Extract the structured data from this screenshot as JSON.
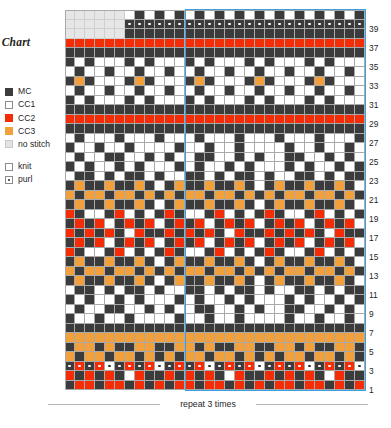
{
  "title": "r Chart",
  "legend": {
    "colors": [
      {
        "key": "MC",
        "label": "MC",
        "hex": "#3b3b3b",
        "swatch": "sw-mc"
      },
      {
        "key": "CC1",
        "label": "CC1",
        "hex": "#ffffff",
        "swatch": "sw-cc1"
      },
      {
        "key": "CC2",
        "label": "CC2",
        "hex": "#f42d06",
        "swatch": "sw-cc2"
      },
      {
        "key": "CC3",
        "label": "CC3",
        "hex": "#f2a03c",
        "swatch": "sw-cc3"
      },
      {
        "key": "NS",
        "label": "no stitch",
        "hex": "#e6e6e6",
        "swatch": "sw-nostitch"
      }
    ],
    "stitches": [
      {
        "key": "knit",
        "label": "knit",
        "swatch": "sw-knit"
      },
      {
        "key": "purl",
        "label": "purl",
        "swatch": "sw-purl"
      }
    ]
  },
  "repeat_caption": "repeat 3 times",
  "repeat_box": {
    "start_col": 13,
    "end_col": 30,
    "color": "#3d9ee0"
  },
  "grid": {
    "columns": 30,
    "rows": 40,
    "cell_px": 10,
    "row_numbers": [
      39,
      37,
      35,
      33,
      31,
      29,
      27,
      25,
      23,
      21,
      19,
      17,
      15,
      13,
      11,
      9,
      7,
      5,
      3,
      1
    ]
  },
  "chart_data": {
    "type": "heatmap",
    "title": "r Chart",
    "xlabel": "",
    "ylabel": "",
    "legend_position": "left",
    "grid": true,
    "palette": {
      "MC": "#3b3b3b",
      "CC1": "#ffffff",
      "CC2": "#f42d06",
      "CC3": "#f2a03c",
      "NS": "#e6e6e6"
    },
    "columns": 30,
    "rows": 40,
    "row_labels_top_to_bottom": [
      40,
      39,
      38,
      37,
      36,
      35,
      34,
      33,
      32,
      31,
      30,
      29,
      28,
      27,
      26,
      25,
      24,
      23,
      22,
      21,
      20,
      19,
      18,
      17,
      16,
      15,
      14,
      13,
      12,
      11,
      10,
      9,
      8,
      7,
      6,
      5,
      4,
      3,
      2,
      1
    ],
    "purl_rows_top_to_bottom": [
      1,
      37
    ],
    "cells": [
      "NS,NS,NS,NS,NS,NS,CC1,MC,CC1,MC,CC1,MC,CC1,MC,CC1,MC,CC1,MC,CC1,MC,CC1,MC,CC1,MC,CC1,MC,CC1,MC,CC1,MC",
      "NS,NS,NS,NS,NS,NS,MC,MC,MC,MC,MC,MC,MC,MC,MC,MC,MC,MC,MC,MC,MC,MC,MC,MC,MC,MC,MC,MC,MC,MC",
      "NS,NS,NS,NS,NS,NS,MC,MC,MC,MC,MC,MC,MC,MC,MC,MC,MC,MC,MC,MC,MC,MC,MC,MC,MC,MC,MC,MC,MC,MC",
      "CC2,CC2,CC2,CC2,CC2,CC2,CC2,CC2,CC2,CC2,CC2,CC2,CC2,CC2,CC2,CC2,CC2,CC2,CC2,CC2,CC2,CC2,CC2,CC2,CC2,CC2,CC2,CC2,CC2,CC2",
      "MC,MC,MC,MC,MC,MC,MC,MC,MC,MC,MC,MC,MC,MC,MC,MC,MC,MC,MC,MC,MC,MC,MC,MC,MC,MC,MC,MC,MC,MC",
      "MC,CC1,MC,CC1,CC1,CC1,MC,CC1,MC,CC1,CC1,CC1,MC,CC1,MC,CC1,CC1,CC1,MC,CC1,MC,CC1,CC1,CC1,MC,CC1,MC,CC1,CC1,CC1",
      "CC1,MC,CC1,CC1,MC,CC1,CC1,MC,CC1,CC1,MC,CC1,CC1,MC,CC1,CC1,MC,CC1,CC1,MC,CC1,CC1,MC,CC1,CC1,MC,CC1,CC1,MC,CC1",
      "MC,CC3,MC,CC1,CC1,CC1,MC,CC3,MC,CC1,CC1,CC1,MC,CC3,MC,CC1,CC1,CC1,MC,CC3,MC,CC1,CC1,CC1,MC,CC3,MC,CC1,CC1,CC1",
      "CC1,MC,CC1,CC1,MC,CC1,CC1,MC,CC1,CC1,MC,CC1,CC1,MC,CC1,CC1,MC,CC1,CC1,MC,CC1,CC1,MC,CC1,CC1,MC,CC1,CC1,MC,CC1",
      "MC,CC1,MC,CC1,CC1,CC1,MC,CC1,MC,CC1,CC1,CC1,MC,CC1,MC,CC1,CC1,CC1,MC,CC1,MC,CC1,CC1,CC1,MC,CC1,MC,CC1,CC1,CC1",
      "MC,MC,MC,MC,MC,MC,MC,MC,MC,MC,MC,MC,MC,MC,MC,MC,MC,MC,MC,MC,MC,MC,MC,MC,MC,MC,MC,MC,MC,MC",
      "CC2,CC2,CC2,CC2,CC2,CC2,CC2,CC2,CC2,CC2,CC2,CC2,CC2,CC2,CC2,CC2,CC2,CC2,CC2,CC2,CC2,CC2,CC2,CC2,CC2,CC2,CC2,CC2,CC2,CC2",
      "MC,MC,MC,MC,MC,MC,MC,MC,MC,MC,MC,MC,MC,MC,MC,MC,MC,MC,MC,MC,MC,MC,MC,MC,MC,MC,MC,MC,MC,MC",
      "CC1,MC,CC1,CC1,CC1,MC,CC1,CC1,CC1,MC,CC1,CC1,CC1,MC,CC1,CC1,CC1,MC,CC1,CC1,CC1,MC,CC1,CC1,CC1,MC,CC1,CC1,CC1,MC",
      "MC,CC1,CC1,MC,CC1,CC1,MC,CC1,CC1,CC1,CC1,MC,CC1,CC1,MC,CC1,CC1,MC,CC1,CC1,CC1,CC1,MC,CC1,CC1,MC,CC1,CC1,MC,CC1",
      "CC1,MC,CC1,CC1,MC,MC,CC1,CC1,MC,CC1,MC,CC1,CC1,MC,MC,CC1,CC1,MC,CC1,MC,CC1,CC1,MC,MC,CC1,CC1,MC,CC1,MC,CC1",
      "MC,CC1,MC,CC1,CC1,MC,CC1,MC,CC1,CC1,CC1,MC,CC1,MC,CC1,CC1,MC,CC1,MC,CC1,CC1,CC1,MC,CC1,MC,CC1,CC1,MC,CC1,MC",
      "CC1,MC,MC,CC1,MC,CC1,MC,MC,CC1,MC,CC1,CC1,MC,MC,CC1,MC,CC1,MC,MC,CC1,MC,CC1,CC1,MC,MC,CC1,MC,CC1,MC,MC",
      "MC,CC3,MC,MC,CC3,MC,MC,CC3,MC,CC1,MC,CC3,MC,MC,CC3,MC,MC,CC3,MC,CC1,MC,CC3,MC,MC,CC3,MC,MC,CC3,MC,CC1",
      "CC3,MC,CC3,CC3,MC,CC3,CC3,MC,CC3,MC,CC3,MC,CC3,CC3,MC,CC3,CC3,MC,CC3,MC,CC3,MC,CC3,CC3,MC,CC3,CC3,MC,CC3,MC",
      "MC,CC3,MC,MC,CC3,MC,MC,CC3,MC,CC1,MC,CC3,MC,MC,CC3,MC,MC,CC3,MC,CC1,MC,CC3,MC,MC,CC3,MC,MC,CC3,MC,CC1",
      "CC2,MC,CC1,CC1,MC,CC2,CC1,MC,CC1,MC,CC2,MC,CC1,CC1,MC,CC2,CC1,MC,CC1,MC,CC2,MC,CC1,CC1,MC,CC2,CC1,MC,CC1,MC",
      "MC,CC2,MC,CC2,CC1,MC,CC2,MC,CC2,CC1,MC,CC2,MC,CC2,CC1,MC,CC2,MC,CC2,CC1,MC,CC2,MC,CC2,CC1,MC,CC2,MC,CC2,CC1",
      "CC2,MC,CC2,MC,CC2,MC,CC1,CC2,MC,MC,CC2,MC,CC2,MC,CC2,MC,CC1,CC2,MC,MC,CC2,MC,CC2,MC,CC2,MC,CC1,CC2,MC,MC",
      "MC,CC2,MC,CC2,CC1,MC,CC2,MC,CC2,CC1,MC,CC2,MC,CC2,CC1,MC,CC2,MC,CC2,CC1,MC,CC2,MC,CC2,CC1,MC,CC2,MC,CC2,CC1",
      "CC2,MC,CC1,CC1,MC,CC2,CC1,MC,CC1,MC,CC2,MC,CC1,CC1,MC,CC2,CC1,MC,CC1,MC,CC2,MC,CC1,CC1,MC,CC2,CC1,MC,CC1,MC",
      "MC,CC3,MC,MC,CC3,MC,MC,CC3,MC,CC1,MC,CC3,MC,MC,CC3,MC,MC,CC3,MC,CC1,MC,CC3,MC,MC,CC3,MC,MC,CC3,MC,CC1",
      "CC3,MC,CC3,CC3,MC,CC3,CC3,MC,CC3,MC,CC3,MC,CC3,CC3,MC,CC3,CC3,MC,CC3,MC,CC3,MC,CC3,CC3,MC,CC3,CC3,MC,CC3,MC",
      "MC,CC3,MC,MC,CC3,MC,MC,CC3,MC,CC1,MC,CC3,MC,MC,CC3,MC,MC,CC3,MC,CC1,MC,CC3,MC,MC,CC3,MC,MC,CC3,MC,CC1",
      "CC1,MC,MC,CC1,MC,CC1,MC,MC,CC1,MC,CC1,CC1,MC,MC,CC1,MC,CC1,MC,MC,CC1,MC,CC1,CC1,MC,MC,CC1,MC,CC1,MC,MC",
      "MC,CC1,MC,CC1,CC1,MC,CC1,MC,CC1,CC1,CC1,MC,CC1,MC,CC1,CC1,MC,CC1,MC,CC1,CC1,CC1,MC,CC1,MC,CC1,CC1,MC,CC1,MC",
      "CC1,MC,CC1,CC1,MC,MC,CC1,CC1,MC,CC1,MC,CC1,CC1,MC,MC,CC1,CC1,MC,CC1,MC,CC1,CC1,MC,MC,CC1,CC1,MC,CC1,MC,CC1",
      "MC,CC1,CC1,MC,CC1,CC1,MC,CC1,CC1,CC1,CC1,MC,CC1,CC1,MC,CC1,CC1,MC,CC1,CC1,CC1,CC1,MC,CC1,CC1,MC,CC1,CC1,MC,CC1",
      "MC,MC,MC,MC,MC,MC,MC,MC,MC,MC,MC,MC,MC,MC,MC,MC,MC,MC,MC,MC,MC,MC,MC,MC,MC,MC,MC,MC,MC,MC",
      "CC3,CC3,CC3,CC3,CC3,CC3,CC3,CC3,CC3,CC3,CC3,CC3,CC3,CC3,CC3,CC3,CC3,CC3,CC3,CC3,CC3,CC3,CC3,CC3,CC3,CC3,CC3,CC3,CC3,CC3",
      "MC,CC3,CC3,MC,CC3,MC,MC,CC3,CC3,MC,MC,CC3,CC3,MC,CC3,MC,MC,CC3,CC3,MC,MC,CC3,CC3,MC,CC3,MC,MC,CC3,CC3,MC",
      "CC3,MC,CC3,CC3,MC,CC3,CC3,MC,CC3,MC,CC3,MC,CC3,CC3,MC,CC3,CC3,MC,CC3,MC,CC3,MC,CC3,CC3,MC,CC3,CC3,MC,CC3,MC",
      "MC,CC2,MC,CC2,CC1,MC,CC2,MC,CC2,CC1,MC,CC2,MC,CC2,CC1,MC,CC2,MC,CC2,CC1,MC,CC2,MC,CC2,CC1,MC,CC2,MC,CC2,CC1",
      "CC2,MC,CC2,MC,CC2,MC,CC1,CC2,MC,MC,CC2,MC,CC2,MC,CC2,MC,CC1,CC2,MC,MC,CC2,MC,CC2,MC,CC2,MC,CC1,CC2,MC,MC",
      "MC,CC2,CC2,MC,CC2,CC2,MC,CC2,MC,CC2,MC,CC2,CC2,MC,CC2,CC2,MC,CC2,MC,CC2,MC,CC2,CC2,MC,CC2,CC2,MC,CC2,MC,CC2"
    ]
  }
}
